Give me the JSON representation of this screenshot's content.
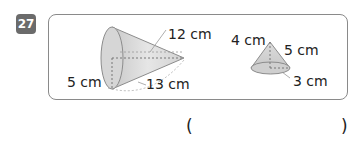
{
  "problem": {
    "number": "27",
    "left_cone": {
      "slant_label": "12 cm",
      "radius_label": "5 cm",
      "height_label": "13 cm"
    },
    "right_cone": {
      "height_label": "4 cm",
      "slant_label": "5 cm",
      "radius_label": "3 cm"
    },
    "answer": {
      "open_paren": "(",
      "close_paren": ")",
      "value": ""
    }
  }
}
